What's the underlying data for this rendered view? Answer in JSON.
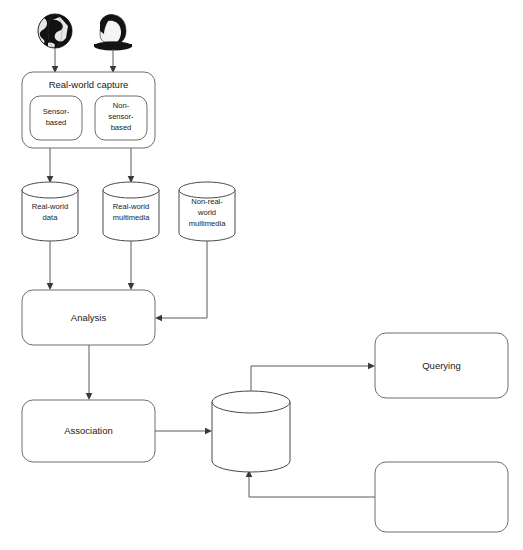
{
  "diagram": {
    "colors": {
      "background": "#ffffff",
      "node_stroke": "#6e6e6e",
      "cylinder_stroke": "#4a4a4a",
      "edge_stroke": "#5a5a5a",
      "text": "#1a1a1a",
      "icon_dark": "#1a1a1a",
      "icon_light": "#f2f2f2"
    },
    "icons": [
      {
        "name": "globe-icon",
        "label": "globe"
      },
      {
        "name": "person-icon",
        "label": "person"
      }
    ],
    "nodes": [
      {
        "id": "real-world-capture",
        "name": "node-real-world-capture",
        "shape": "rounded-rect",
        "label": "Real-world capture",
        "children": [
          {
            "id": "sensor-based",
            "name": "node-sensor-based",
            "shape": "rounded-rect",
            "label_lines": [
              "Sensor-",
              "based"
            ]
          },
          {
            "id": "non-sensor-based",
            "name": "node-non-sensor-based",
            "shape": "rounded-rect",
            "label_lines": [
              "Non-",
              "sensor-",
              "based"
            ]
          }
        ]
      },
      {
        "id": "real-world-data",
        "name": "node-real-world-data",
        "shape": "cylinder",
        "label_lines": [
          "Real-world",
          "data"
        ]
      },
      {
        "id": "real-world-multimedia",
        "name": "node-real-world-multimedia",
        "shape": "cylinder",
        "label_lines": [
          "Real-world",
          "multimedia"
        ]
      },
      {
        "id": "non-real-world-multimedia",
        "name": "node-non-real-world-multimedia",
        "shape": "cylinder",
        "label_lines": [
          "Non-real-",
          "world",
          "multimedia"
        ]
      },
      {
        "id": "analysis",
        "name": "node-analysis",
        "shape": "rounded-rect",
        "label": "Analysis"
      },
      {
        "id": "association",
        "name": "node-association",
        "shape": "rounded-rect",
        "label": "Association"
      },
      {
        "id": "real-world-multimedia-resource",
        "name": "node-real-world-multimedia-resource",
        "shape": "cylinder",
        "label_lines": [
          "Real-world",
          "multimedia",
          "resource"
        ]
      },
      {
        "id": "retrieval",
        "name": "node-retrieval",
        "shape": "rounded-rect",
        "label": "Retrieval"
      },
      {
        "id": "querying",
        "name": "node-querying",
        "shape": "rounded-rect",
        "label": "Querying"
      }
    ],
    "edges": [
      {
        "from": "globe-icon",
        "to": "real-world-capture",
        "arrow": true
      },
      {
        "from": "person-icon",
        "to": "real-world-capture",
        "arrow": true
      },
      {
        "from": "sensor-based",
        "to": "real-world-data",
        "arrow": true
      },
      {
        "from": "non-sensor-based",
        "to": "real-world-multimedia",
        "arrow": true
      },
      {
        "from": "real-world-data",
        "to": "analysis",
        "arrow": true
      },
      {
        "from": "real-world-multimedia",
        "to": "analysis",
        "arrow": true
      },
      {
        "from": "non-real-world-multimedia",
        "to": "analysis",
        "arrow": true
      },
      {
        "from": "analysis",
        "to": "association",
        "arrow": true
      },
      {
        "from": "association",
        "to": "real-world-multimedia-resource",
        "arrow": true
      },
      {
        "from": "real-world-multimedia-resource",
        "to": "retrieval",
        "arrow": true
      },
      {
        "from": "querying",
        "to": "real-world-multimedia-resource",
        "arrow": true
      }
    ]
  }
}
